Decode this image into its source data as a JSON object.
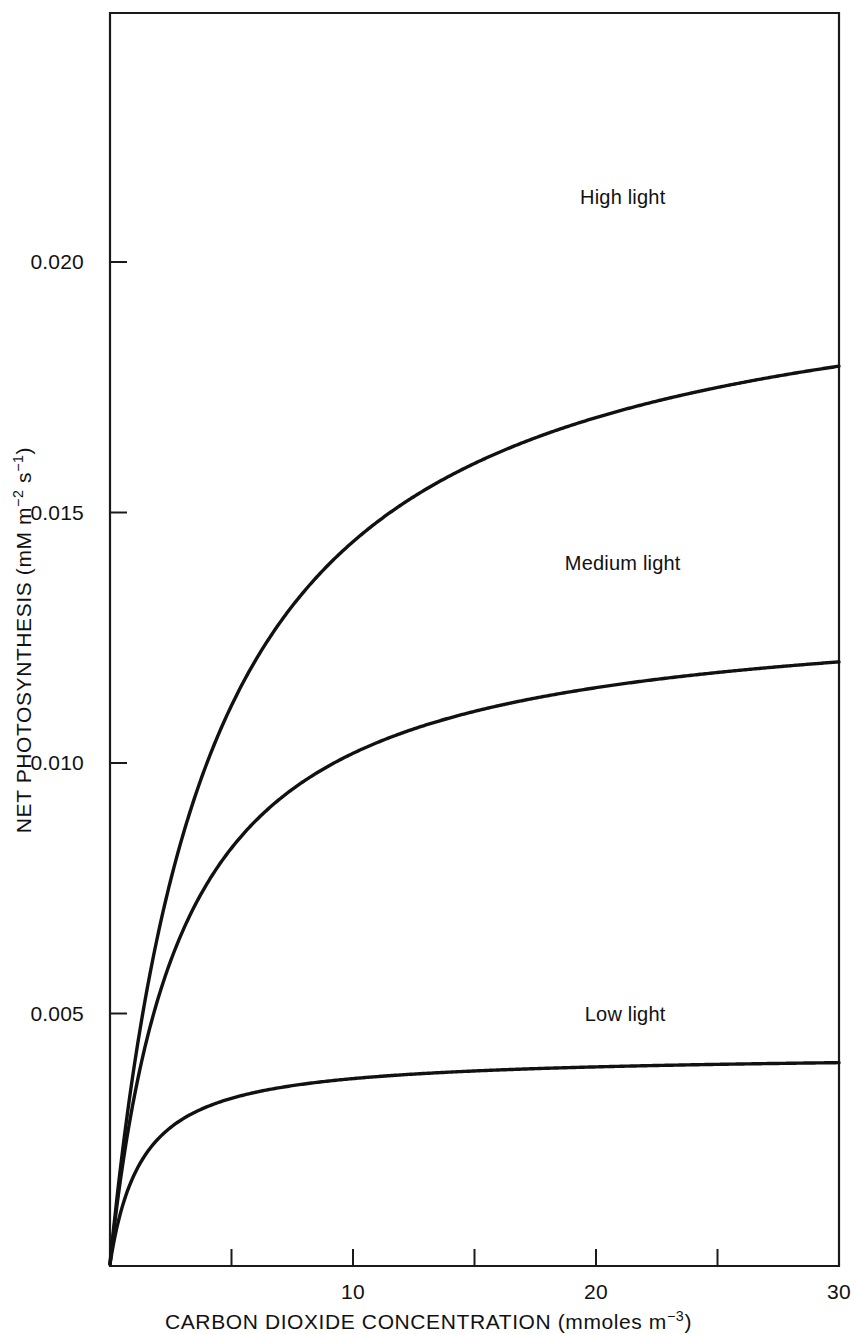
{
  "chart_data": {
    "type": "line",
    "title": "",
    "xlabel": "CARBON DIOXIDE CONCENTRATION (mmoles m⁻³)",
    "ylabel": "NET PHOTOSYNTHESIS (mM m⁻² s⁻¹)",
    "xlabel_parts": {
      "main": "CARBON DIOXIDE CONCENTRATION (mmoles m",
      "exponent": "−3",
      "tail": ")"
    },
    "ylabel_parts": {
      "main": "NET PHOTOSYNTHESIS (mM m",
      "exponent1": "−2",
      "mid": " s",
      "exponent2": "−1",
      "tail": ")"
    },
    "xlim": [
      0,
      30
    ],
    "ylim": [
      0,
      0.0252
    ],
    "grid": false,
    "legend_position": "inline-above-curve",
    "xticks": [
      0,
      5,
      10,
      15,
      20,
      25,
      30
    ],
    "xtick_labels": [
      "",
      "",
      "10",
      "",
      "20",
      "",
      "30"
    ],
    "yticks": [
      0.005,
      0.01,
      0.015,
      0.02
    ],
    "ytick_labels": [
      "0.005",
      "0.010",
      "0.015",
      "0.020"
    ],
    "series": [
      {
        "name": "High light",
        "label": "High light",
        "plateau": 0.0204,
        "half_saturation": 4.15,
        "color": "#111111",
        "x": [
          0,
          0.5,
          1,
          1.5,
          2,
          2.5,
          3,
          3.5,
          4,
          4.5,
          5,
          5.5,
          6,
          7,
          8,
          9,
          10,
          11,
          12,
          13,
          14,
          15,
          16,
          18,
          20,
          22,
          25,
          28,
          30
        ],
        "y": [
          0.0,
          0.00219,
          0.00396,
          0.00542,
          0.00663,
          0.00767,
          0.00856,
          0.00933,
          0.01,
          0.0106,
          0.01114,
          0.01162,
          0.01205,
          0.0128,
          0.01343,
          0.01395,
          0.0144,
          0.01479,
          0.01512,
          0.01542,
          0.01568,
          0.01592,
          0.01613,
          0.01649,
          0.01678,
          0.01703,
          0.01733,
          0.01758,
          0.01772
        ]
      },
      {
        "name": "Medium light",
        "label": "Medium light",
        "plateau": 0.0132,
        "half_saturation": 2.95,
        "color": "#111111",
        "x": [
          0,
          0.5,
          1,
          1.5,
          2,
          2.5,
          3,
          3.5,
          4,
          4.5,
          5,
          6,
          7,
          8,
          9,
          10,
          12,
          14,
          16,
          18,
          20,
          24,
          28,
          30
        ],
        "y": [
          0.0,
          0.00192,
          0.00334,
          0.00445,
          0.00533,
          0.00605,
          0.00666,
          0.00717,
          0.00761,
          0.00798,
          0.00831,
          0.00886,
          0.0093,
          0.00966,
          0.00996,
          0.01021,
          0.01061,
          0.01092,
          0.01116,
          0.01135,
          0.01151,
          0.01177,
          0.01195,
          0.01203
        ]
      },
      {
        "name": "Low light",
        "label": "Low light",
        "plateau": 0.0042,
        "half_saturation": 1.35,
        "color": "#111111",
        "x": [
          0,
          0.25,
          0.5,
          0.75,
          1,
          1.5,
          2,
          2.5,
          3,
          3.5,
          4,
          5,
          6,
          7,
          8,
          9,
          10,
          12,
          14,
          16,
          20,
          24,
          28,
          30
        ],
        "y": [
          0.0,
          0.00093,
          0.00154,
          0.00197,
          0.0023,
          0.00277,
          0.00309,
          0.00333,
          0.00351,
          0.00365,
          0.00376,
          0.00393,
          0.00404,
          0.00413,
          0.00419,
          0.00424,
          0.00428,
          0.00434,
          0.00438,
          0.00441,
          0.00445,
          0.00448,
          0.0045,
          0.00451
        ]
      }
    ],
    "annotations": [
      {
        "text": "High light",
        "x": 21.1,
        "y": 0.0213,
        "series": "High light"
      },
      {
        "text": "Medium light",
        "x": 21.1,
        "y": 0.014,
        "series": "Medium light"
      },
      {
        "text": "Low light",
        "x": 21.2,
        "y": 0.005,
        "series": "Low light"
      }
    ]
  }
}
